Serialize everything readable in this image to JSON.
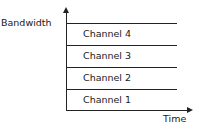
{
  "diagram": {
    "y_axis_label": "Bandwidth",
    "x_axis_label": "Time",
    "channels": [
      {
        "label": "Channel 4"
      },
      {
        "label": "Channel 3"
      },
      {
        "label": "Channel 2"
      },
      {
        "label": "Channel 1"
      }
    ]
  }
}
